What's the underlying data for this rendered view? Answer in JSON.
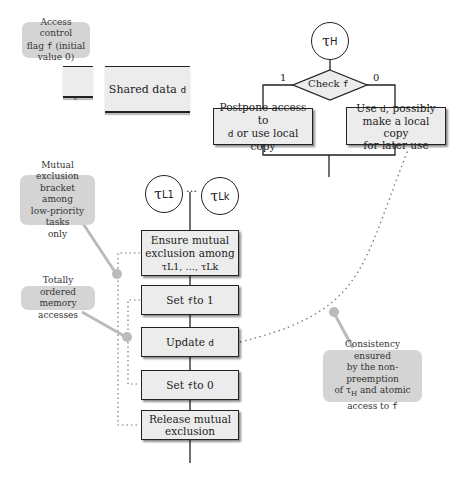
{
  "shared": {
    "flag_callout": "Access control flag f (initial value 0)",
    "flag_callout_parts": {
      "a": "Access control",
      "b": "flag ",
      "c": "f",
      "d": " (initial",
      "e": "value 0)"
    },
    "shared_data_label": "Shared data ",
    "shared_data_var": "d"
  },
  "high_task": {
    "name": "τ",
    "sub": "H",
    "decision": {
      "label": "Check ",
      "var": "f"
    },
    "branch_1_label": "1",
    "branch_0_label": "0",
    "branch_1_box": {
      "line1": "Postpone access to",
      "var": "d",
      "line2_rest": " or use local copy"
    },
    "branch_0_box": {
      "line1_pre": "Use ",
      "var": "d",
      "line1_post": ", possibly",
      "line2": "make a local copy",
      "line3": "for later use"
    }
  },
  "low_tasks": {
    "first": {
      "name": "τ",
      "sub": "L1"
    },
    "ellipsis": "…",
    "last": {
      "name": "τ",
      "sub": "Lk"
    },
    "steps": [
      {
        "id": "ensure",
        "line1": "Ensure mutual",
        "line2": "exclusion among",
        "line3": "τL1, …, τLk"
      },
      {
        "id": "set1",
        "pre": "Set ",
        "var": "f",
        "post": " to 1"
      },
      {
        "id": "update",
        "pre": "Update ",
        "var": "d"
      },
      {
        "id": "set0",
        "pre": "Set ",
        "var": "f",
        "post": " to 0"
      },
      {
        "id": "release",
        "line1": "Release mutual",
        "line2": "exclusion"
      }
    ]
  },
  "callouts": {
    "mutex_bracket": [
      "Mutual exclusion",
      "bracket among",
      "low-priority tasks",
      "only"
    ],
    "ordered": [
      "Totally ordered",
      "memory accesses"
    ],
    "consistency": {
      "l1": "Consistency ensured",
      "l2": "by the non-preemption",
      "l3_pre": "of τ",
      "l3_sub": "H",
      "l3_post": " and atomic",
      "l4_pre": "access to ",
      "l4_var": "f"
    }
  },
  "colors": {
    "box_fill": "#ececec",
    "callout_fill": "#d4d4d4",
    "line": "#222222",
    "dots": "#777777"
  }
}
